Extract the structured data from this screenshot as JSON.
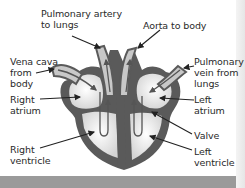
{
  "diagram": {
    "labels": {
      "pulmonary_artery": "Pulmonary artery\nto lungs",
      "aorta": "Aorta to body",
      "vena_cava": "Vena cava\nfrom\nbody",
      "pulmonary_vein": "Pulmonary\nvein from\nlungs",
      "right_atrium": "Right\natrium",
      "left_atrium": "Left\natrium",
      "valve": "Valve",
      "right_ventricle": "Right\nventricle",
      "left_ventricle": "Left\nventricle"
    },
    "colors": {
      "wall": "#5a5a5a",
      "chamber": "#f0f0f0",
      "vessel": "#c8c8c8",
      "flow_arrow": "#555555",
      "footer_bar": "#9a9a9a"
    }
  }
}
